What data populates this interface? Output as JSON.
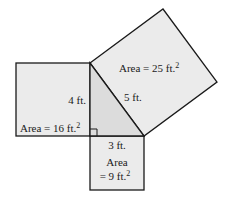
{
  "diagram": {
    "type": "pythagorean-theorem",
    "colors": {
      "square_fill": "#ebebeb",
      "triangle_fill": "#dcdcdc",
      "stroke": "#1a1a1a",
      "background": "#ffffff"
    },
    "left_square": {
      "side_label": "4 ft.",
      "area_label": "Area = 16 ft.",
      "area_sup": "2"
    },
    "bottom_square": {
      "side_label": "3 ft.",
      "area_label_line1": "Area",
      "area_label_line2": "= 9 ft.",
      "area_sup": "2"
    },
    "hyp_square": {
      "side_label": "5 ft.",
      "area_label": "Area = 25 ft.",
      "area_sup": "2"
    }
  }
}
